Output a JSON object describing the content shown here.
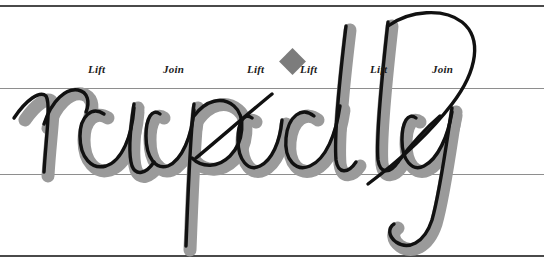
{
  "figure": {
    "script_word": "rapidly",
    "ink_color": "#111111",
    "shadow_color": "#9a9a9a",
    "paper_color": "#ffffff"
  },
  "guidelines": [
    {
      "name": "ascender-line",
      "y": 5,
      "color": "#4a4a4a",
      "weight": 2
    },
    {
      "name": "waist-line",
      "y": 88,
      "color": "#8e8e8e",
      "weight": 1
    },
    {
      "name": "base-line",
      "y": 174,
      "color": "#8e8e8e",
      "weight": 1
    },
    {
      "name": "descender-line",
      "y": 255,
      "color": "#4a4a4a",
      "weight": 2
    }
  ],
  "annotations": [
    {
      "id": "lift-1",
      "label": "Lift",
      "x": 88,
      "y": 64
    },
    {
      "id": "join-1",
      "label": "Join",
      "x": 163,
      "y": 64
    },
    {
      "id": "lift-2",
      "label": "Lift",
      "x": 247,
      "y": 64
    },
    {
      "id": "lift-3",
      "label": "Lift",
      "x": 300,
      "y": 64
    },
    {
      "id": "lift-4",
      "label": "Lift",
      "x": 370,
      "y": 64
    },
    {
      "id": "join-2",
      "label": "Join",
      "x": 432,
      "y": 64
    }
  ],
  "markers": [
    {
      "id": "diamond-1",
      "shape": "diamond",
      "color": "#7c7c7c",
      "x": 283,
      "y": 52,
      "size": 19
    }
  ]
}
